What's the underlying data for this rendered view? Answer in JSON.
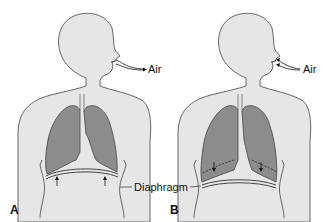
{
  "figure": {
    "panels": [
      {
        "id": "A",
        "label": "A",
        "air_label": "Air",
        "phase": "exhalation",
        "diaphragm_motion": "up"
      },
      {
        "id": "B",
        "label": "B",
        "air_label": "Air",
        "phase": "inhalation",
        "diaphragm_motion": "down"
      }
    ],
    "shared_label": "Diaphragm",
    "colors": {
      "body_fill": "#e6e6e6",
      "lung_fill": "#8c8c8c",
      "outline": "#444444",
      "background": "#ffffff"
    }
  }
}
